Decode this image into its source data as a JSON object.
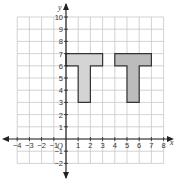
{
  "graph": {
    "x_axis_label": "x",
    "y_axis_label": "y",
    "origin_label": "O",
    "x_range": [
      -4,
      8
    ],
    "y_range": [
      -2,
      10
    ],
    "x_ticks": [
      "-4",
      "-3",
      "-2",
      "-1",
      "1",
      "2",
      "3",
      "4",
      "5",
      "6",
      "7",
      "8"
    ],
    "y_ticks": [
      "10",
      "9",
      "8",
      "7",
      "6",
      "5",
      "4",
      "3",
      "2",
      "1",
      "-1",
      "-2"
    ],
    "grid": true
  },
  "shapes": [
    {
      "name": "T-shape-left",
      "fill": "#d4d4d4",
      "vertices": [
        [
          0,
          7
        ],
        [
          3,
          7
        ],
        [
          3,
          6
        ],
        [
          2,
          6
        ],
        [
          2,
          3
        ],
        [
          1,
          3
        ],
        [
          1,
          6
        ],
        [
          0,
          6
        ]
      ]
    },
    {
      "name": "T-shape-right",
      "fill": "#bcbcbc",
      "vertices": [
        [
          4,
          7
        ],
        [
          7,
          7
        ],
        [
          7,
          6
        ],
        [
          6,
          6
        ],
        [
          6,
          3
        ],
        [
          5,
          3
        ],
        [
          5,
          6
        ],
        [
          4,
          6
        ]
      ]
    }
  ],
  "colors": {
    "grid": "#c8c8c8",
    "axis": "#222222",
    "outline": "#333333"
  }
}
